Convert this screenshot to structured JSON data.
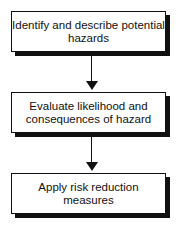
{
  "flowchart": {
    "steps": [
      {
        "label": "Identify and describe potential hazards"
      },
      {
        "label": "Evaluate likelihood and consequences of hazard"
      },
      {
        "label": "Apply risk reduction measures"
      }
    ],
    "colors": {
      "stroke": "#111111",
      "fill": "#ffffff"
    }
  }
}
